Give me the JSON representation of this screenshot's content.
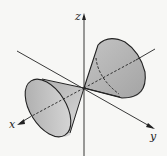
{
  "diagram": {
    "type": "double-cone-3d",
    "axes": {
      "x_label": "x",
      "y_label": "y",
      "z_label": "z"
    },
    "colors": {
      "background": "#f7f7f5",
      "line": "#222222",
      "cone_fill": "#b8b8b8",
      "cone_fill_light": "#d9d9d9"
    }
  }
}
